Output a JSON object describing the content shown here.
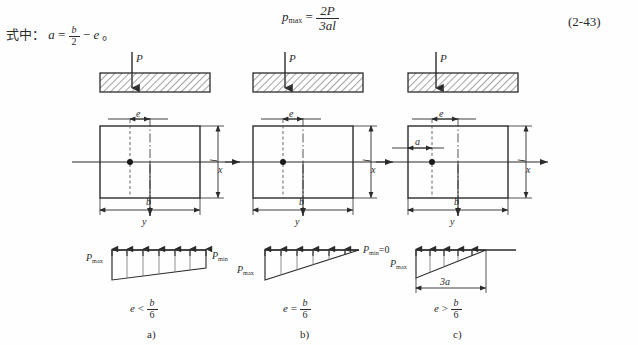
{
  "page": {
    "note_prefix": "式中：",
    "note_formula": {
      "lhs": "a",
      "eq": "=",
      "frac_num": "b",
      "frac_den": "2",
      "minus": "−",
      "rhs": "e",
      "period": "。"
    },
    "main_formula": {
      "lhs": "p",
      "lhs_sub": "max",
      "eq": "=",
      "num": "2P",
      "den": "3al"
    },
    "equation_number": "(2-43)"
  },
  "columns": [
    {
      "key": "a",
      "caption": "a)",
      "load_label": "P",
      "plan": {
        "ecc_label": "e",
        "width_label": "b",
        "height_label": "l",
        "x_axis_label": "x",
        "y_axis_label": "y",
        "inner_dim_label": null
      },
      "pressure": {
        "shape": "trapezoid",
        "left_label": "P",
        "left_sub": "max",
        "right_label": "P",
        "right_sub": "min",
        "right_suffix": "",
        "base_dim_label": null,
        "arrow_count": 7
      },
      "condition": {
        "lhs": "e",
        "op": "<",
        "num": "b",
        "den": "6"
      }
    },
    {
      "key": "b",
      "caption": "b)",
      "load_label": "P",
      "plan": {
        "ecc_label": "e",
        "width_label": "b",
        "height_label": "l",
        "x_axis_label": "x",
        "y_axis_label": "y",
        "inner_dim_label": null
      },
      "pressure": {
        "shape": "triangle",
        "left_label": "P",
        "left_sub": "max",
        "right_label": "P",
        "right_sub": "min",
        "right_suffix": "=0",
        "base_dim_label": null,
        "arrow_count": 6
      },
      "condition": {
        "lhs": "e",
        "op": "=",
        "num": "b",
        "den": "6"
      }
    },
    {
      "key": "c",
      "caption": "c)",
      "load_label": "P",
      "plan": {
        "ecc_label": "e",
        "width_label": "b",
        "height_label": "l",
        "x_axis_label": "x",
        "y_axis_label": "y",
        "inner_dim_label": "a"
      },
      "pressure": {
        "shape": "triangle-partial",
        "left_label": "P",
        "left_sub": "max",
        "right_label": "",
        "right_sub": "",
        "right_suffix": "",
        "base_dim_label": "3a",
        "arrow_count": 5
      },
      "condition": {
        "lhs": "e",
        "op": ">",
        "num": "b",
        "den": "6"
      }
    }
  ],
  "colors": {
    "ink": "#2b2b2b",
    "line": "#333333",
    "hatch": "#555555",
    "background": "#fefefe"
  }
}
